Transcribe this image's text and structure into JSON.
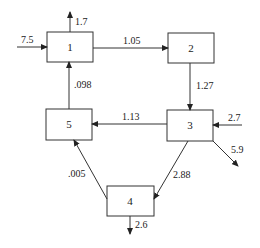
{
  "diagram": {
    "type": "flow-network",
    "nodes": [
      {
        "id": "1",
        "label": "1",
        "x": 47,
        "y": 32,
        "w": 46,
        "h": 30
      },
      {
        "id": "2",
        "label": "2",
        "x": 168,
        "y": 33,
        "w": 46,
        "h": 30
      },
      {
        "id": "3",
        "label": "3",
        "x": 167,
        "y": 110,
        "w": 46,
        "h": 31
      },
      {
        "id": "4",
        "label": "4",
        "x": 107,
        "y": 186,
        "w": 47,
        "h": 30
      },
      {
        "id": "5",
        "label": "5",
        "x": 46,
        "y": 109,
        "w": 46,
        "h": 31
      }
    ],
    "edges": [
      {
        "from": "external",
        "to": "1",
        "label": "7.5"
      },
      {
        "from": "1",
        "to": "external",
        "label": "1.7"
      },
      {
        "from": "1",
        "to": "2",
        "label": "1.05"
      },
      {
        "from": "2",
        "to": "3",
        "label": "1.27"
      },
      {
        "from": "external",
        "to": "3",
        "label": "2.7"
      },
      {
        "from": "3",
        "to": "external",
        "label": "5.9"
      },
      {
        "from": "3",
        "to": "5",
        "label": "1.13"
      },
      {
        "from": "3",
        "to": "4",
        "label": "2.88"
      },
      {
        "from": "4",
        "to": "5",
        "label": ".005"
      },
      {
        "from": "4",
        "to": "external",
        "label": "2.6"
      },
      {
        "from": "5",
        "to": "1",
        "label": ".098"
      }
    ]
  }
}
